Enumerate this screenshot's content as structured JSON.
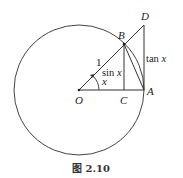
{
  "figure": {
    "caption": "图 2.10",
    "points": {
      "O": {
        "label": "O",
        "x": 79,
        "y": 90
      },
      "A": {
        "label": "A",
        "x": 144,
        "y": 90
      },
      "B": {
        "label": "B",
        "x": 124,
        "y": 44
      },
      "C": {
        "label": "C",
        "x": 124,
        "y": 90
      },
      "D": {
        "label": "D",
        "x": 144,
        "y": 25
      }
    },
    "circle": {
      "cx": 79,
      "cy": 90,
      "r": 65
    },
    "labels": {
      "radius": "1",
      "sin": "sin",
      "tan": "tan",
      "var": "x",
      "angle": "x"
    },
    "colors": {
      "stroke": "#333333",
      "text": "#222222"
    }
  }
}
